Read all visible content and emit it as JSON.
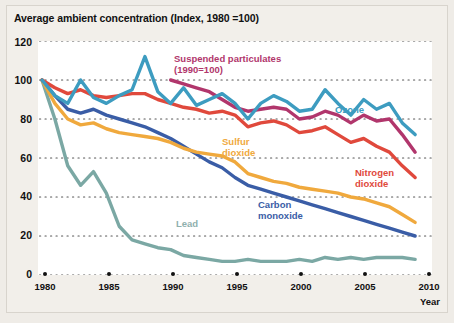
{
  "chart_data": {
    "type": "line",
    "title": "Average ambient concentration (Index, 1980 =100)",
    "xlabel": "Year",
    "ylabel": "",
    "xlim": [
      1980,
      2010
    ],
    "ylim": [
      0,
      120
    ],
    "ytick_labels": [
      "0",
      "20",
      "40",
      "60",
      "80",
      "100",
      "120"
    ],
    "ytick_values": [
      0,
      20,
      40,
      60,
      80,
      100,
      120
    ],
    "xtick_labels": [
      "1980",
      "1985",
      "1990",
      "1995",
      "2000",
      "2005",
      "2010"
    ],
    "xtick_values": [
      1980,
      1985,
      1990,
      1995,
      2000,
      2005,
      2010
    ],
    "grid": "horizontal-dotted",
    "legend": "inline-annotations",
    "x": [
      1980,
      1981,
      1982,
      1983,
      1984,
      1985,
      1986,
      1987,
      1988,
      1989,
      1990,
      1991,
      1992,
      1993,
      1994,
      1995,
      1996,
      1997,
      1998,
      1999,
      2000,
      2001,
      2002,
      2003,
      2004,
      2005,
      2006,
      2007,
      2008,
      2009
    ],
    "series": [
      {
        "name": "Ozone",
        "color": "#3d9cc0",
        "label": "Ozone",
        "values": [
          100,
          92,
          88,
          100,
          91,
          88,
          92,
          95,
          112,
          94,
          88,
          96,
          87,
          90,
          93,
          88,
          80,
          88,
          92,
          89,
          84,
          85,
          95,
          88,
          82,
          90,
          85,
          88,
          78,
          72
        ]
      },
      {
        "name": "Suspended particulates",
        "color": "#b1366c",
        "label": "Suspended particulates",
        "sublabel": "(1990=100)",
        "note": "Indexed to 1990 = 100",
        "values": [
          null,
          null,
          null,
          null,
          null,
          null,
          null,
          null,
          null,
          null,
          100,
          98,
          96,
          94,
          90,
          86,
          84,
          85,
          86,
          85,
          80,
          81,
          84,
          82,
          78,
          82,
          79,
          80,
          72,
          63
        ]
      },
      {
        "name": "Nitrogen dioxide",
        "color": "#e0493c",
        "label": "Nitrogen dioxide",
        "values": [
          100,
          96,
          93,
          95,
          92,
          91,
          92,
          93,
          93,
          90,
          88,
          86,
          85,
          83,
          84,
          82,
          76,
          78,
          79,
          77,
          73,
          74,
          76,
          72,
          68,
          70,
          66,
          63,
          56,
          50
        ]
      },
      {
        "name": "Sulfur dioxide",
        "color": "#f0a93d",
        "label": "Sulfur dioxide",
        "values": [
          100,
          88,
          80,
          77,
          78,
          75,
          73,
          72,
          71,
          70,
          68,
          65,
          63,
          62,
          61,
          58,
          52,
          50,
          48,
          47,
          45,
          44,
          43,
          42,
          40,
          39,
          37,
          35,
          31,
          27
        ]
      },
      {
        "name": "Carbon monoxide",
        "color": "#3a5da6",
        "label": "Carbon monoxide",
        "values": [
          100,
          92,
          85,
          83,
          85,
          82,
          80,
          78,
          76,
          73,
          70,
          66,
          62,
          58,
          55,
          50,
          46,
          44,
          42,
          40,
          38,
          36,
          34,
          32,
          30,
          28,
          26,
          24,
          22,
          20
        ]
      },
      {
        "name": "Lead",
        "color": "#7ba8a4",
        "label": "Lead",
        "values": [
          100,
          80,
          56,
          46,
          53,
          42,
          25,
          18,
          16,
          14,
          13,
          10,
          9,
          8,
          7,
          7,
          8,
          7,
          7,
          7,
          8,
          7,
          9,
          8,
          9,
          8,
          9,
          9,
          9,
          8
        ]
      }
    ]
  },
  "axis": {
    "year_label": "Year"
  }
}
